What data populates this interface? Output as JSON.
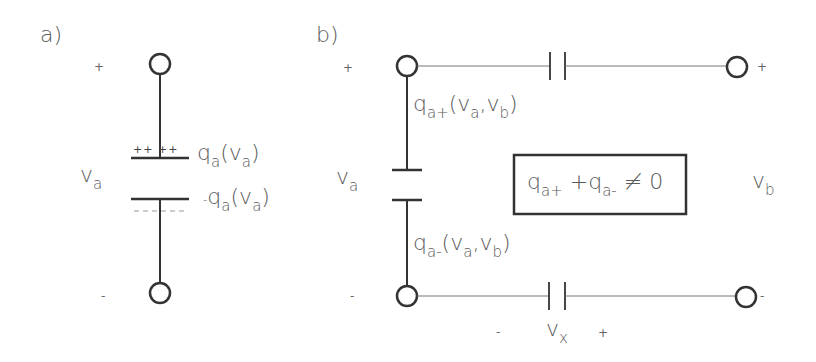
{
  "panel_a": {
    "label": "a)",
    "plus_sign": "+",
    "minus_sign": "-",
    "voltage": {
      "base": "v",
      "sub": "a"
    },
    "top_plate_charges": "++ ++",
    "bottom_plate_charges": "-- --",
    "top_charge": {
      "base": "q",
      "sub": "a",
      "open": "(v",
      "arg_sub": "a",
      "close": ")"
    },
    "bottom_charge": {
      "prefix": "-",
      "base": "q",
      "sub": "a",
      "open": "(v",
      "arg_sub": "a",
      "close": ")"
    }
  },
  "panel_b": {
    "label": "b)",
    "plus_sign_left": "+",
    "minus_sign_left": "-",
    "plus_sign_right": "+",
    "minus_sign_right": "-",
    "voltage_left": {
      "base": "v",
      "sub": "a"
    },
    "voltage_right": {
      "base": "v",
      "sub": "b"
    },
    "voltage_x": {
      "base": "v",
      "sub": "x",
      "minus": "-",
      "plus": "+"
    },
    "top_charge": {
      "base": "q",
      "sub": "a+",
      "args": "(v",
      "arg1_sub": "a",
      "comma": ",v",
      "arg2_sub": "b",
      "close": ")"
    },
    "bottom_charge": {
      "base": "q",
      "sub": "a-",
      "args": "(v",
      "arg1_sub": "a",
      "comma": ",v",
      "arg2_sub": "b",
      "close": ")"
    },
    "box_equation": {
      "t1": "q",
      "t1_sub": "a+",
      "plus": " +q",
      "t2_sub": "a-",
      "rel": " ≠ 0"
    }
  },
  "colors": {
    "line": "#3a3a3a",
    "thin_line": "#777777",
    "text": "#5a5a5a"
  }
}
